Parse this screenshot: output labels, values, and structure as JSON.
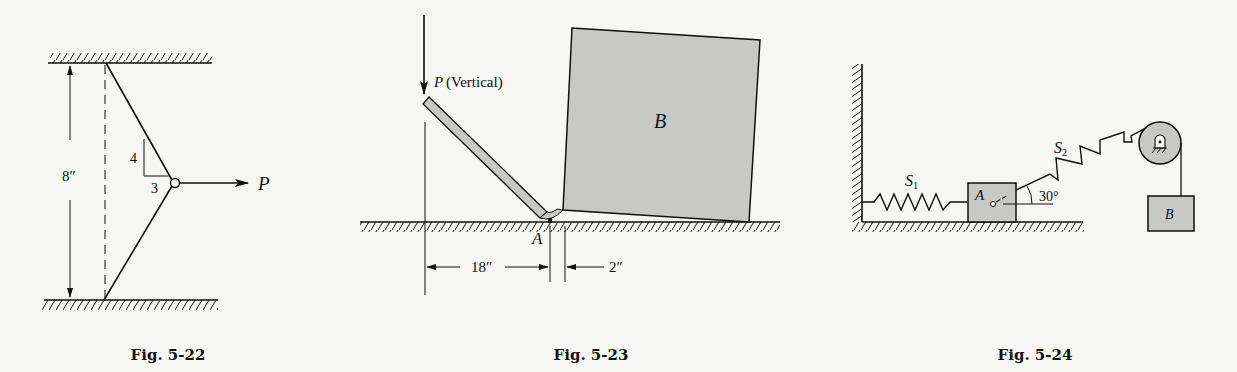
{
  "figures": [
    {
      "id": "fig-5-22",
      "caption": "Fig. 5-22",
      "labels": {
        "dimension": "8″",
        "slope_rise": "4",
        "slope_run": "3",
        "force": "P"
      }
    },
    {
      "id": "fig-5-23",
      "caption": "Fig. 5-23",
      "labels": {
        "force": "P",
        "force_note": "(Vertical)",
        "block": "B",
        "pivot": "A",
        "dim_left": "18″",
        "dim_right": "2″"
      }
    },
    {
      "id": "fig-5-24",
      "caption": "Fig. 5-24",
      "labels": {
        "spring_1": "S",
        "spring_1_sub": "1",
        "spring_2": "S",
        "spring_2_sub": "2",
        "block_a": "A",
        "block_b": "B",
        "angle": "30°"
      }
    }
  ],
  "colors": {
    "ink": "#111111",
    "fill_gray": "#c8c8c6",
    "paper": "#f6f6f4"
  }
}
